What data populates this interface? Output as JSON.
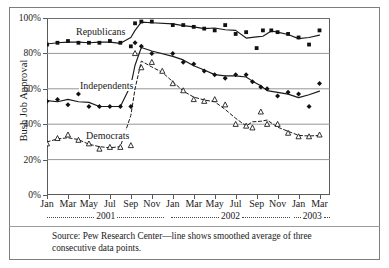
{
  "figure": {
    "ylabel": "Bush Job Approval",
    "source_note": "Source: Pew Research Center—line shows smoothed average of three consecutive data points."
  },
  "axis": {
    "y_ticks": [
      "0%",
      "20%",
      "40%",
      "60%",
      "80%",
      "100%"
    ],
    "x_ticks": [
      "Jan",
      "Mar",
      "May",
      "Jul",
      "Sep",
      "Nov",
      "Jan",
      "Mar",
      "May",
      "Jul",
      "Sep",
      "Nov",
      "Jan",
      "Mar"
    ],
    "year_bands": [
      {
        "label": "2001"
      },
      {
        "label": "2002"
      },
      {
        "label": "2003"
      }
    ]
  },
  "series_tags": [
    {
      "name": "Republicans"
    },
    {
      "name": "Independents"
    },
    {
      "name": "Democrats"
    }
  ],
  "chart_data": {
    "type": "line",
    "title": "",
    "xlabel": "",
    "ylabel": "Bush Job Approval",
    "ylim": [
      0,
      100
    ],
    "xlim": [
      0,
      27
    ],
    "grid": "horizontal",
    "legend": "inline-annotations",
    "annotation": "Source: Pew Research Center—line shows smoothed average of three consecutive data points.",
    "x_tick_labels": [
      "Jan",
      "Mar",
      "May",
      "Jul",
      "Sep",
      "Nov",
      "Jan",
      "Mar",
      "May",
      "Jul",
      "Sep",
      "Nov",
      "Jan",
      "Mar"
    ],
    "x_tick_positions": [
      0,
      2,
      4,
      6,
      8,
      10,
      12,
      14,
      16,
      18,
      20,
      22,
      24,
      26
    ],
    "y_tick_labels": [
      "0%",
      "20%",
      "40%",
      "60%",
      "80%",
      "100%"
    ],
    "y_tick_positions": [
      0,
      20,
      40,
      60,
      80,
      100
    ],
    "x_periods": [
      "2001-01",
      "2001-02",
      "2001-03",
      "2001-04",
      "2001-05",
      "2001-06",
      "2001-07",
      "2001-08",
      "2001-09a",
      "2001-09b",
      "2001-10",
      "2001-11",
      "2001-12",
      "2002-01",
      "2002-02",
      "2002-03",
      "2002-04",
      "2002-05",
      "2002-06",
      "2002-07",
      "2002-08",
      "2002-09",
      "2002-10",
      "2002-11",
      "2002-12",
      "2003-01",
      "2003-02",
      "2003-03"
    ],
    "series": [
      {
        "name": "Republicans",
        "marker": "filled-square",
        "line_style": "solid",
        "color": "#1a1a1a",
        "x": [
          0,
          1,
          2,
          3,
          4,
          5,
          6,
          7,
          8,
          8.4,
          9,
          10,
          12,
          13,
          14,
          15,
          16,
          17,
          18,
          19,
          20,
          20.6,
          21.4,
          22,
          23,
          24,
          25,
          26
        ],
        "values": [
          85,
          86,
          87,
          86,
          86,
          86,
          87,
          86,
          84,
          97,
          98,
          98,
          96,
          96,
          95,
          94,
          93,
          96,
          91,
          92,
          83,
          93,
          93,
          92,
          91,
          89,
          85,
          93
        ]
      },
      {
        "name": "Independents",
        "marker": "filled-diamond",
        "line_style": "solid",
        "color": "#1a1a1a",
        "x": [
          0,
          1,
          2,
          3,
          4,
          5,
          6,
          7,
          8,
          8.4,
          9,
          10,
          12,
          13,
          14,
          15,
          16,
          17,
          18,
          19,
          19.6,
          20.4,
          21,
          22,
          23,
          24,
          25,
          26
        ],
        "values": [
          53,
          54,
          51,
          57,
          50,
          50,
          50,
          50,
          50,
          86,
          84,
          80,
          80,
          75,
          74,
          70,
          68,
          66,
          68,
          68,
          64,
          61,
          60,
          56,
          58,
          57,
          50,
          63
        ]
      },
      {
        "name": "Democrats",
        "marker": "open-triangle",
        "line_style": "dashed",
        "color": "#1a1a1a",
        "x": [
          0,
          1,
          2,
          3,
          4,
          5,
          6,
          7,
          8,
          8.4,
          9,
          10,
          11,
          12,
          13,
          14,
          15,
          16,
          17,
          18,
          19,
          19.6,
          20.4,
          21,
          22,
          23,
          24,
          25,
          26
        ],
        "values": [
          29,
          32,
          34,
          31,
          29,
          26,
          27,
          27,
          28,
          80,
          72,
          75,
          70,
          63,
          59,
          54,
          53,
          54,
          51,
          40,
          39,
          38,
          47,
          40,
          40,
          35,
          33,
          33,
          34
        ]
      }
    ]
  }
}
